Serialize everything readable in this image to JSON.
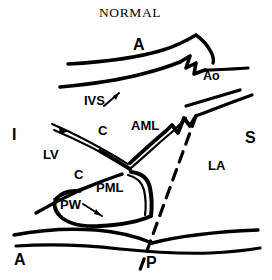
{
  "title": "NORMAL",
  "colors": {
    "ink": "#000000",
    "background": "#ffffff"
  },
  "orientation_labels": {
    "superior": "A",
    "inferior": "A",
    "left": "I",
    "right": "S",
    "bottom": "P"
  },
  "labels": {
    "anterior_top": "A",
    "aorta": "Ao",
    "ivs": "IVS",
    "aml": "AML",
    "pml": "PML",
    "pw": "PW",
    "lv": "LV",
    "la": "LA",
    "chordae_upper": "C",
    "chordae_lower": "C",
    "inferior_axis": "I",
    "superior_axis": "S",
    "anterior_axis": "A",
    "posterior_axis": "P"
  },
  "legend_meanings": {
    "A": "Anterior",
    "P": "Posterior",
    "I": "Inferior",
    "S": "Superior",
    "Ao": "Aorta",
    "IVS": "Interventricular Septum",
    "AML": "Anterior Mitral Leaflet",
    "PML": "Posterior Mitral Leaflet",
    "PW": "Posterior Wall",
    "LV": "Left Ventricle",
    "LA": "Left Atrium",
    "C": "Chordae"
  }
}
